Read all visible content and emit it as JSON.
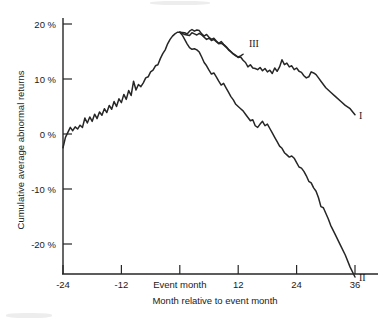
{
  "chart_data": {
    "type": "line",
    "title": "",
    "xlabel": "Month relative to event month",
    "ylabel": "Cumulative average abnormal returns",
    "xlim": [
      -24,
      37
    ],
    "ylim": [
      -28,
      22
    ],
    "grid": false,
    "legend_position": "inline-right-of-curve",
    "x_tick_values": [
      -24,
      -12,
      0,
      12,
      24,
      36
    ],
    "x_tick_labels": [
      "-24",
      "-12",
      "Event month",
      "12",
      "24",
      "36"
    ],
    "y_tick_values": [
      20,
      10,
      0,
      -10,
      -20
    ],
    "y_tick_labels": [
      "20 %",
      "10 %",
      "0 %",
      "-10 %",
      "-20 %"
    ],
    "annotations": [
      {
        "text": "I",
        "x": 36.8,
        "y": 3.4
      },
      {
        "text": "II",
        "x": 36.8,
        "y": -26.0
      },
      {
        "text": "III",
        "x": 14.2,
        "y": 16.6
      }
    ],
    "series": [
      {
        "name": "Common pre-event path",
        "label": "",
        "x": [
          -24,
          -23.5,
          -23,
          -22.5,
          -22,
          -21.5,
          -21,
          -20.5,
          -20,
          -19.5,
          -19,
          -18.5,
          -18,
          -17.5,
          -17,
          -16.5,
          -16,
          -15.5,
          -15,
          -14.5,
          -14,
          -13.5,
          -13,
          -12.5,
          -12,
          -11.5,
          -11,
          -10.5,
          -10,
          -9.5,
          -9,
          -8.5,
          -8,
          -7.5,
          -7,
          -6.5,
          -6,
          -5.5,
          -5,
          -4.5,
          -4,
          -3.5,
          -3,
          -2.5,
          -2,
          -1.5,
          -1,
          -0.5,
          0
        ],
        "values": [
          -2.5,
          -0.6,
          0.3,
          1.2,
          0.6,
          1.3,
          0.9,
          1.6,
          1.2,
          2.9,
          2.0,
          3.1,
          2.3,
          3.6,
          2.8,
          4.0,
          3.4,
          4.6,
          3.9,
          5.2,
          4.5,
          5.9,
          5.0,
          6.4,
          5.7,
          7.2,
          6.3,
          7.9,
          7.0,
          9.6,
          8.0,
          9.0,
          8.6,
          9.3,
          10.2,
          10.4,
          11.3,
          11.6,
          12.4,
          12.6,
          13.7,
          14.6,
          15.3,
          16.4,
          17.2,
          17.8,
          18.2,
          18.5,
          18.5
        ]
      },
      {
        "name": "Curve I",
        "label": "I",
        "x": [
          0,
          1,
          1.5,
          2,
          2.5,
          3,
          3.5,
          4,
          4.5,
          5,
          5.5,
          6,
          6.5,
          7,
          7.5,
          8,
          8.5,
          9,
          9.5,
          10,
          10.5,
          11,
          11.5,
          12,
          12.5,
          13,
          13.5,
          14,
          14.5,
          15,
          15.5,
          16,
          16.5,
          17,
          17.5,
          18,
          18.5,
          19,
          19.5,
          20,
          20.5,
          21,
          21.5,
          22,
          22.5,
          23,
          23.5,
          24,
          24.5,
          25,
          25.5,
          26,
          26.5,
          27,
          27.5,
          28,
          28.5,
          29,
          29.5,
          30,
          31,
          32,
          33,
          34,
          35,
          36
        ],
        "values": [
          18.5,
          18.4,
          18.2,
          18.7,
          19.0,
          18.7,
          18.9,
          18.8,
          18.2,
          17.8,
          18.1,
          17.6,
          17.2,
          17.4,
          16.9,
          16.5,
          16.8,
          16.3,
          15.9,
          15.4,
          15.0,
          14.6,
          14.3,
          13.9,
          14.0,
          13.4,
          13.0,
          12.2,
          12.6,
          12.0,
          11.9,
          11.7,
          12.1,
          11.5,
          11.9,
          11.3,
          11.6,
          11.0,
          12.0,
          11.4,
          12.2,
          13.5,
          12.6,
          12.9,
          12.2,
          12.4,
          11.7,
          12.0,
          11.4,
          11.2,
          10.6,
          10.2,
          10.4,
          11.3,
          11.1,
          10.8,
          10.2,
          9.6,
          9.0,
          8.4,
          7.6,
          6.8,
          6.0,
          5.2,
          4.6,
          3.5
        ]
      },
      {
        "name": "Curve II",
        "label": "II",
        "x": [
          0,
          0.5,
          1,
          1.5,
          2,
          2.5,
          3,
          3.5,
          4,
          4.5,
          5,
          5.5,
          6,
          6.5,
          7,
          7.5,
          8,
          8.5,
          9,
          9.5,
          10,
          10.5,
          11,
          11.5,
          12,
          12.5,
          13,
          13.5,
          14,
          14.5,
          15,
          15.5,
          16,
          16.5,
          17,
          17.5,
          18,
          18.5,
          19,
          19.5,
          20,
          20.5,
          21,
          21.5,
          22,
          22.5,
          23,
          23.5,
          24,
          24.5,
          25,
          25.5,
          26,
          26.5,
          27,
          27.5,
          28,
          28.5,
          29,
          29.5,
          30,
          30.5,
          31,
          32,
          33,
          34,
          35,
          36
        ],
        "values": [
          18.5,
          18.0,
          17.2,
          16.4,
          15.7,
          15.4,
          15.5,
          15.3,
          14.9,
          14.0,
          13.0,
          12.4,
          11.6,
          10.9,
          11.1,
          10.4,
          9.6,
          8.9,
          9.2,
          8.4,
          7.6,
          6.8,
          6.2,
          5.4,
          5.0,
          4.6,
          4.2,
          3.6,
          3.0,
          2.4,
          2.6,
          1.5,
          1.2,
          1.8,
          2.3,
          1.5,
          1.8,
          1.0,
          0.2,
          -0.6,
          -1.4,
          -2.2,
          -2.6,
          -3.4,
          -3.8,
          -4.2,
          -4.0,
          -4.4,
          -5.2,
          -6.0,
          -6.2,
          -6.8,
          -7.6,
          -8.6,
          -8.9,
          -9.8,
          -10.4,
          -11.6,
          -13.2,
          -13.4,
          -14.4,
          -15.4,
          -16.6,
          -18.4,
          -20.2,
          -22.0,
          -24.2,
          -26.0
        ]
      },
      {
        "name": "Curve III",
        "label": "III",
        "x": [
          0,
          0.5,
          1,
          1.5,
          2,
          2.5,
          3,
          3.5,
          4,
          4.5,
          5,
          5.5,
          6,
          6.5,
          7,
          7.5,
          8,
          8.5,
          9,
          9.5,
          10,
          10.5,
          11,
          11.5,
          12,
          12.5,
          13
        ],
        "values": [
          18.5,
          18.3,
          18.1,
          18.0,
          17.9,
          18.4,
          18.2,
          18.0,
          18.3,
          18.0,
          17.6,
          17.2,
          17.4,
          17.0,
          17.2,
          16.8,
          16.4,
          16.5,
          16.2,
          15.8,
          15.3,
          14.9,
          14.5,
          14.2,
          14.0,
          14.2,
          14.5
        ]
      }
    ]
  },
  "axis_titles": {
    "x": "Month relative to event month",
    "y": "Cumulative average abnormal returns"
  }
}
